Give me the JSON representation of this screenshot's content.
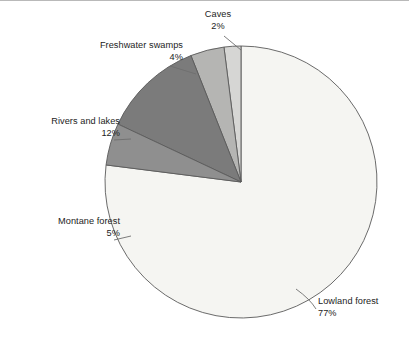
{
  "chart_data": {
    "type": "pie",
    "title": "",
    "subtitle": "",
    "xlabel": "",
    "ylabel": "",
    "legend_position": "none",
    "grid": false,
    "labels_show_percent": true,
    "total_percent": 100,
    "categories": [
      "Lowland forest",
      "Caves",
      "Freshwater swamps",
      "Rivers and lakes",
      "Montane forest"
    ],
    "values": [
      77,
      2,
      4,
      12,
      5
    ],
    "slices": [
      {
        "key": "lowland-forest",
        "label": "Lowland forest",
        "percent_text": "77%",
        "value": 77,
        "color": "#f5f5f2",
        "label_align": "left"
      },
      {
        "key": "caves",
        "label": "Caves",
        "percent_text": "2%",
        "value": 2,
        "color": "#d6d6d4",
        "label_align": "center"
      },
      {
        "key": "freshwater-swamps",
        "label": "Freshwater swamps",
        "percent_text": "4%",
        "value": 4,
        "color": "#b5b5b3",
        "label_align": "right"
      },
      {
        "key": "rivers-and-lakes",
        "label": "Rivers and lakes",
        "percent_text": "12%",
        "value": 12,
        "color": "#7b7b7b",
        "label_align": "right"
      },
      {
        "key": "montane-forest",
        "label": "Montane forest",
        "percent_text": "5%",
        "value": 5,
        "color": "#8f8f8f",
        "label_align": "right"
      }
    ],
    "geometry": {
      "center_x": 241,
      "center_y": 182,
      "radius": 136,
      "start_angle_deg": -90,
      "direction": "counterclockwise"
    },
    "style": {
      "background": "#ffffff",
      "outline": "#5a5a5a",
      "text_color": "#232323",
      "leader_line": "#6e6e6e"
    }
  }
}
